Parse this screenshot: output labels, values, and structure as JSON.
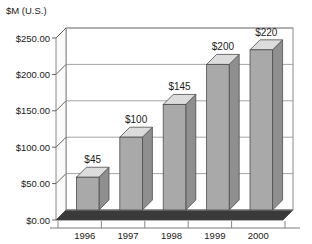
{
  "chart_data": {
    "type": "bar",
    "title": "",
    "ylabel": "$M (U.S.)",
    "xlabel": "",
    "categories": [
      "1996",
      "1997",
      "1998",
      "1999",
      "2000"
    ],
    "values": [
      45,
      100,
      145,
      200,
      220
    ],
    "data_labels": [
      "$45",
      "$100",
      "$145",
      "$200",
      "$220"
    ],
    "ylim": [
      0,
      250
    ],
    "ytick_values": [
      0,
      50,
      100,
      150,
      200,
      250
    ],
    "ytick_labels": [
      "$0.00",
      "$50.00",
      "$100.00",
      "$150.00",
      "$200.00",
      "$250.00"
    ],
    "grid": true,
    "grid_axis": "y",
    "legend": false,
    "style": "3d-column",
    "colors": {
      "bar_front": "#a9a9a9",
      "bar_top": "#dcdcdc",
      "bar_side": "#8f8f8f",
      "floor": "#3a3a3a",
      "grid": "#9a9a9a",
      "axis": "#555555",
      "background": "#ffffff",
      "text": "#1a1a1a"
    }
  },
  "axis": {
    "y_axis_title": "$M (U.S.)"
  }
}
